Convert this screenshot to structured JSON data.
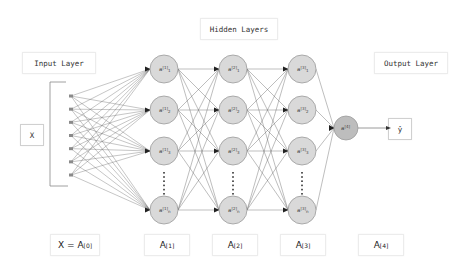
{
  "diagram": {
    "labels": {
      "hidden_layers": "Hidden Layers",
      "input_layer": "Input Layer",
      "output_layer": "Output Layer",
      "input_x": "X",
      "output_yhat": "ŷ"
    },
    "bottom_labels": [
      {
        "base": "X = A",
        "sup": "[0]"
      },
      {
        "base": "A",
        "sup": "[1]"
      },
      {
        "base": "A",
        "sup": "[2]"
      },
      {
        "base": "A",
        "sup": "[3]"
      },
      {
        "base": "A",
        "sup": "[4]"
      }
    ],
    "input_nodes": 7,
    "hidden_layers": [
      {
        "layer": 1,
        "nodes": [
          "a[1]1",
          "a[1]2",
          "a[1]3",
          "a[1]n"
        ]
      },
      {
        "layer": 2,
        "nodes": [
          "a[2]1",
          "a[2]2",
          "a[2]3",
          "a[2]n"
        ]
      },
      {
        "layer": 3,
        "nodes": [
          "a[3]1",
          "a[3]2",
          "a[3]3",
          "a[3]n"
        ]
      }
    ],
    "output_node": "a[4]",
    "colors": {
      "node_fill": "#d9d9d9",
      "node_stroke": "#9a9a9a",
      "edge": "#555555",
      "input_dot": "#8a8a8a"
    }
  }
}
